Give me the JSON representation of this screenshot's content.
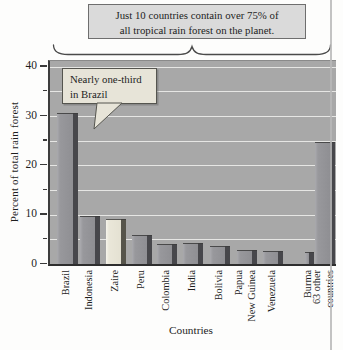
{
  "chart_data": {
    "type": "bar",
    "title": "",
    "xlabel": "Countries",
    "ylabel": "Percent of total rain forest",
    "ylim": [
      0,
      40
    ],
    "yticks_major": [
      0,
      10,
      20,
      30,
      40
    ],
    "yticks_minor": [
      5,
      15,
      25,
      35
    ],
    "gridlines": [
      5,
      10,
      15,
      20,
      25,
      30,
      35,
      40
    ],
    "grid": "on",
    "legend": "none",
    "categories": [
      "Brazil",
      "Indonesia",
      "Zaire",
      "Peru",
      "Colombia",
      "India",
      "Bolivia",
      "Papua\nNew Guinea",
      "Venezuela",
      "Burma",
      "63 other\ncountries"
    ],
    "values": [
      30.5,
      9.6,
      8.9,
      5.7,
      3.9,
      4.1,
      3.4,
      2.6,
      2.4,
      2.2,
      24.5
    ],
    "highlighted_category": "Zaire",
    "annotations": [
      {
        "text": "Just 10 countries contain over 75% of\nall tropical rain forest on the planet.",
        "target": "first 10 bars"
      },
      {
        "text": "Nearly one-third\nin Brazil",
        "target": "Brazil"
      }
    ],
    "colors": {
      "plot_background": "#a8a8a8",
      "bar_face": "#8f8f93",
      "bar_shadow": "#47474b",
      "highlight_face": "#e4e1d2",
      "gridline": "#e6e6e4",
      "axis": "#3a3a3a",
      "note_fill": "#dadada",
      "callout_fill": "#e7e4d8"
    }
  }
}
